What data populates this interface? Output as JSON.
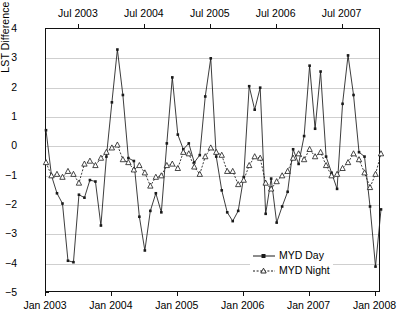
{
  "chart_data": {
    "type": "line",
    "title": "",
    "xlabel": "",
    "ylabel": "LST Difference (°C)",
    "ylim": [
      -5,
      4
    ],
    "yticks": [
      4,
      3,
      2,
      1,
      0,
      -1,
      -2,
      -3,
      -4,
      -5
    ],
    "ytick_labels": [
      "4",
      "3",
      "2",
      "1",
      "0",
      "−1",
      "−2",
      "−3",
      "−4",
      "−5"
    ],
    "grid": true,
    "grid_axis": "y",
    "xlim": [
      0,
      61
    ],
    "xticks_bottom": [
      0,
      12,
      24,
      36,
      48,
      60
    ],
    "xtick_labels_bottom": [
      "Jan 2003",
      "Jan 2004",
      "Jan 2005",
      "Jan 2006",
      "Jan 2007",
      "Jan 2008"
    ],
    "xticks_top": [
      6,
      18,
      30,
      42,
      54
    ],
    "xtick_labels_top": [
      "Jul 2003",
      "Jul 2004",
      "Jul 2005",
      "Jul 2006",
      "Jul 2007"
    ],
    "legend_position": "bottom-right",
    "series": [
      {
        "name": "MYD Day",
        "marker": "filled-square",
        "linestyle": "solid",
        "color": "#1a1a1a",
        "x": [
          0,
          1,
          2,
          3,
          4,
          5,
          6,
          7,
          8,
          9,
          10,
          11,
          12,
          13,
          14,
          15,
          16,
          17,
          18,
          19,
          20,
          21,
          22,
          23,
          24,
          25,
          26,
          27,
          28,
          29,
          30,
          31,
          32,
          33,
          34,
          35,
          36,
          37,
          38,
          39,
          40,
          41,
          42,
          43,
          44,
          45,
          46,
          47,
          48,
          49,
          50,
          51,
          52,
          53,
          54,
          55,
          56,
          57,
          58,
          59,
          60,
          61
        ],
        "values": [
          0.55,
          -1.0,
          -1.6,
          -1.95,
          -3.9,
          -3.95,
          -1.65,
          -1.75,
          -1.15,
          -1.2,
          -2.7,
          -0.35,
          1.5,
          3.3,
          1.75,
          -0.4,
          -0.5,
          -2.4,
          -3.55,
          -2.2,
          -1.6,
          -2.25,
          0.1,
          2.35,
          0.4,
          -0.1,
          0.1,
          -0.55,
          -0.3,
          1.7,
          3.0,
          -0.35,
          -1.5,
          -2.25,
          -2.55,
          -2.2,
          -1.05,
          2.05,
          1.25,
          2.0,
          -2.3,
          -1.1,
          -2.6,
          -2.05,
          -1.55,
          -0.1,
          -0.6,
          0.35,
          2.75,
          0.6,
          2.55,
          -0.35,
          -0.9,
          -1.45,
          1.45,
          3.1,
          1.75,
          -0.2,
          -0.35,
          -2.05,
          -4.1,
          -2.15
        ]
      },
      {
        "name": "MYD Night",
        "marker": "open-triangle",
        "linestyle": "dotted",
        "color": "#1a1a1a",
        "x": [
          0,
          1,
          2,
          3,
          4,
          5,
          6,
          7,
          8,
          9,
          10,
          11,
          12,
          13,
          14,
          15,
          16,
          17,
          18,
          19,
          20,
          21,
          22,
          23,
          24,
          25,
          26,
          27,
          28,
          29,
          30,
          31,
          32,
          33,
          34,
          35,
          36,
          37,
          38,
          39,
          40,
          41,
          42,
          43,
          44,
          45,
          46,
          47,
          48,
          49,
          50,
          51,
          52,
          53,
          54,
          55,
          56,
          57,
          58,
          59,
          60,
          61
        ],
        "values": [
          -0.55,
          -1.0,
          -0.95,
          -1.05,
          -0.85,
          -0.95,
          -1.25,
          -0.6,
          -0.5,
          -0.65,
          -0.4,
          -0.2,
          -0.05,
          0.05,
          -0.45,
          -0.55,
          -0.8,
          -0.65,
          -0.9,
          -1.35,
          -1.05,
          -1.0,
          -0.65,
          -0.6,
          -0.75,
          -0.2,
          -0.25,
          -0.7,
          -0.95,
          -0.35,
          -0.05,
          -0.2,
          -0.3,
          -0.85,
          -0.85,
          -1.3,
          -1.15,
          -0.65,
          -0.35,
          -0.4,
          -1.25,
          -1.45,
          -1.2,
          -1.0,
          -0.85,
          -0.4,
          -0.25,
          -0.45,
          -0.1,
          -0.35,
          -0.2,
          -0.65,
          -1.0,
          -0.95,
          -0.75,
          -0.55,
          -0.25,
          -0.45,
          -0.9,
          -1.4,
          -0.95,
          -0.25
        ]
      }
    ]
  },
  "legend": {
    "items": [
      {
        "label": "MYD Day"
      },
      {
        "label": "MYD Night"
      }
    ]
  }
}
